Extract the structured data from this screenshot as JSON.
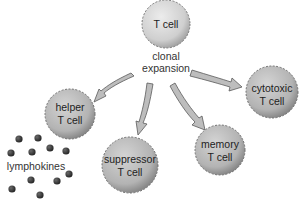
{
  "diagram": {
    "source_cell": {
      "label": "T cell",
      "cx": 166,
      "cy": 24,
      "r": 24
    },
    "process_label": {
      "line1": "clonal",
      "line2": "expansion"
    },
    "daughter_cells": [
      {
        "id": "helper",
        "line1": "helper",
        "line2": "T cell",
        "cx": 70,
        "cy": 114,
        "r": 25
      },
      {
        "id": "suppressor",
        "line1": "suppressor",
        "line2": "T cell",
        "cx": 130,
        "cy": 165,
        "r": 28
      },
      {
        "id": "memory",
        "line1": "memory",
        "line2": "T cell",
        "cx": 220,
        "cy": 150,
        "r": 25
      },
      {
        "id": "cytotoxic",
        "line1": "cytotoxic",
        "line2": "T cell",
        "cx": 272,
        "cy": 92,
        "r": 26
      }
    ],
    "secretion": {
      "label": "lymphokines",
      "from": "helper",
      "dots": [
        [
          19,
          139
        ],
        [
          38,
          138
        ],
        [
          11,
          153
        ],
        [
          32,
          152
        ],
        [
          50,
          148
        ],
        [
          66,
          151
        ],
        [
          31,
          180
        ],
        [
          57,
          181
        ],
        [
          69,
          174
        ],
        [
          12,
          189
        ],
        [
          40,
          195
        ]
      ]
    },
    "colors": {
      "cell_fill_light": "#e0e0e0",
      "source_cell_fill": "#d6d6d6",
      "daughter_cell_fill": "#b8b8b8",
      "cell_outline": "#6e6e6e",
      "arrow_fill": "#bdbdbd",
      "arrow_outline": "#5a5a5a",
      "dot_color": "#3a3a3a",
      "text_color": "#222222"
    }
  }
}
